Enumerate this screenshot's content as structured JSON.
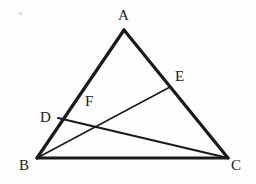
{
  "figure": {
    "canvas": {
      "width": 256,
      "height": 184,
      "background": "#fefefe"
    },
    "stroke_color": "#1a1a1a",
    "label_color": "#1b1b1b",
    "points": {
      "A": {
        "x": 124,
        "y": 30
      },
      "B": {
        "x": 37,
        "y": 158
      },
      "C": {
        "x": 228,
        "y": 158
      },
      "D": {
        "x": 58,
        "y": 118
      },
      "E": {
        "x": 170,
        "y": 87
      },
      "F": {
        "x": 88,
        "y": 113
      }
    },
    "segments": [
      {
        "name": "side-AB",
        "from": "A",
        "to": "B",
        "width": 3.2
      },
      {
        "name": "side-AC",
        "from": "A",
        "to": "C",
        "width": 3.2
      },
      {
        "name": "side-BC",
        "from": "B",
        "to": "C",
        "width": 3.2
      },
      {
        "name": "cevian-DC",
        "from": "D",
        "to": "C",
        "width": 2.2
      },
      {
        "name": "cevian-BE",
        "from": "B",
        "to": "E",
        "width": 1.5
      }
    ],
    "labels": [
      {
        "name": "label-A",
        "text": "A",
        "x": 118,
        "y": 8
      },
      {
        "name": "label-B",
        "text": "B",
        "x": 19,
        "y": 158
      },
      {
        "name": "label-C",
        "text": "C",
        "x": 231,
        "y": 158
      },
      {
        "name": "label-D",
        "text": "D",
        "x": 40,
        "y": 110
      },
      {
        "name": "label-E",
        "text": "E",
        "x": 175,
        "y": 69
      },
      {
        "name": "label-F",
        "text": "F",
        "x": 85,
        "y": 94
      }
    ],
    "specks": [
      {
        "name": "artifact-speck",
        "x": 19,
        "y": 12,
        "size": 3
      }
    ]
  }
}
